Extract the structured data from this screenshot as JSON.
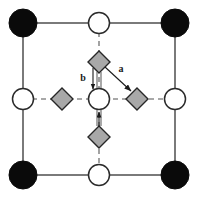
{
  "figure": {
    "kind": "crystal-lattice-unit-cell",
    "width": 199,
    "height": 198,
    "background": "#ffffff"
  },
  "colors": {
    "corner_atom_fill": "#0a0a0a",
    "corner_atom_stroke": "#0a0a0a",
    "open_atom_fill": "#ffffff",
    "open_atom_stroke": "#2b2b2b",
    "diamond_fill": "#a8a8a8",
    "diamond_stroke": "#262626",
    "solid_bond": "#7a7a7a",
    "dashed_bond": "#8c8c8c",
    "arrow": "#1a1a1a",
    "label_text": "#1a1a1a"
  },
  "geometry": {
    "cell": {
      "left": 23,
      "top": 23,
      "right": 175,
      "bottom": 175
    },
    "center": {
      "x": 99,
      "y": 99
    },
    "corner_radius": 14,
    "open_radius": 10.5,
    "diamond_half": 11,
    "solid_bond_width": 2,
    "dashed_bond_width": 1.6,
    "dash_pattern": "5 4"
  },
  "atoms": {
    "corner_label": "filled-corner-atom",
    "open_label": "open-atom",
    "diamond_label": "gray-diamond-site",
    "corners": [
      {
        "name": "atom-corner-top-left",
        "x": 23,
        "y": 23
      },
      {
        "name": "atom-corner-top-right",
        "x": 175,
        "y": 23
      },
      {
        "name": "atom-corner-bottom-left",
        "x": 23,
        "y": 175
      },
      {
        "name": "atom-corner-bottom-right",
        "x": 175,
        "y": 175
      }
    ],
    "open": [
      {
        "name": "atom-edge-top",
        "x": 99,
        "y": 23
      },
      {
        "name": "atom-edge-left",
        "x": 23,
        "y": 99
      },
      {
        "name": "atom-center",
        "x": 99,
        "y": 99
      },
      {
        "name": "atom-edge-right",
        "x": 175,
        "y": 99
      },
      {
        "name": "atom-edge-bottom",
        "x": 99,
        "y": 175
      }
    ],
    "diamonds": [
      {
        "name": "diamond-site-top",
        "x": 99,
        "y": 62
      },
      {
        "name": "diamond-site-left",
        "x": 62,
        "y": 99
      },
      {
        "name": "diamond-site-right",
        "x": 137,
        "y": 99
      },
      {
        "name": "diamond-site-bottom",
        "x": 99,
        "y": 137
      }
    ]
  },
  "bonds": {
    "solid": [
      {
        "name": "bond-top-edge",
        "x1": 23,
        "y1": 23,
        "x2": 175,
        "y2": 23
      },
      {
        "name": "bond-bottom-edge",
        "x1": 23,
        "y1": 175,
        "x2": 175,
        "y2": 175
      },
      {
        "name": "bond-left-edge",
        "x1": 23,
        "y1": 23,
        "x2": 23,
        "y2": 175
      },
      {
        "name": "bond-right-edge",
        "x1": 175,
        "y1": 23,
        "x2": 175,
        "y2": 175
      }
    ],
    "dashed": [
      {
        "name": "bond-vertical-midline",
        "x1": 99,
        "y1": 23,
        "x2": 99,
        "y2": 175
      },
      {
        "name": "bond-horizontal-midline",
        "x1": 23,
        "y1": 99,
        "x2": 175,
        "y2": 99
      }
    ]
  },
  "vectors": [
    {
      "name": "vector-a",
      "label": "a",
      "label_x": 124,
      "label_y": 69,
      "x1": 104,
      "y1": 66,
      "x2": 133,
      "y2": 93,
      "description": "diagonal arrow from top diamond toward right diamond"
    },
    {
      "name": "vector-b",
      "label": "b",
      "label_x": 83,
      "label_y": 80,
      "x1": 93,
      "y1": 69,
      "x2": 93,
      "y2": 90,
      "description": "vertical arrow pointing down toward center atom"
    }
  ],
  "double_lines": [
    {
      "name": "double-line-upper",
      "x": 99,
      "y1": 72,
      "y2": 88
    },
    {
      "name": "double-line-lower",
      "x": 99,
      "y1": 110,
      "y2": 126
    }
  ],
  "lower_arrow": {
    "name": "arrow-up-lower",
    "x": 99,
    "y1": 126,
    "y2": 111
  }
}
